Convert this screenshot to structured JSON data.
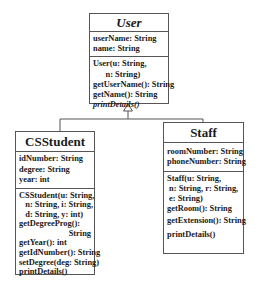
{
  "diagram": {
    "type": "UML class diagram",
    "classes": {
      "user": {
        "name": "User",
        "abstract": true,
        "attributes": [
          "userName: String",
          "name: String"
        ],
        "methods": [
          {
            "text": "User(u: String,"
          },
          {
            "text": "      n: String)"
          },
          {
            "text": "getUserName(): String"
          },
          {
            "text": "getName(): String"
          },
          {
            "text": "printDetails()",
            "italic": true
          }
        ]
      },
      "csstudent": {
        "name": "CSStudent",
        "abstract": false,
        "attributes": [
          "idNumber: String",
          "degree: String",
          "year: int"
        ],
        "methods": [
          {
            "text": "CSStudent(u: String,"
          },
          {
            "text": "   n: String, i: String,"
          },
          {
            "text": "   d: String, y: int)"
          },
          {
            "text": "getDegreeProg():"
          },
          {
            "text": "String",
            "align": "right"
          },
          {
            "text": "getYear(): int"
          },
          {
            "text": "getIdNumber(): String"
          },
          {
            "text": "setDegree(deg: String)"
          },
          {
            "text": "printDetails()"
          }
        ]
      },
      "staff": {
        "name": "Staff",
        "abstract": false,
        "attributes": [
          "roomNumber: String",
          "phoneNumber: String"
        ],
        "methods": [
          {
            "text": "Staff(u: String,"
          },
          {
            "text": " n: String, r: String,"
          },
          {
            "text": " e: String)"
          },
          {
            "text": "getRoom(): String"
          },
          {
            "text": "getExtension(): String"
          },
          {
            "text": "printDetails()"
          }
        ]
      }
    },
    "relationships": [
      {
        "type": "generalization",
        "from": "CSStudent",
        "to": "User"
      },
      {
        "type": "generalization",
        "from": "Staff",
        "to": "User"
      }
    ]
  }
}
